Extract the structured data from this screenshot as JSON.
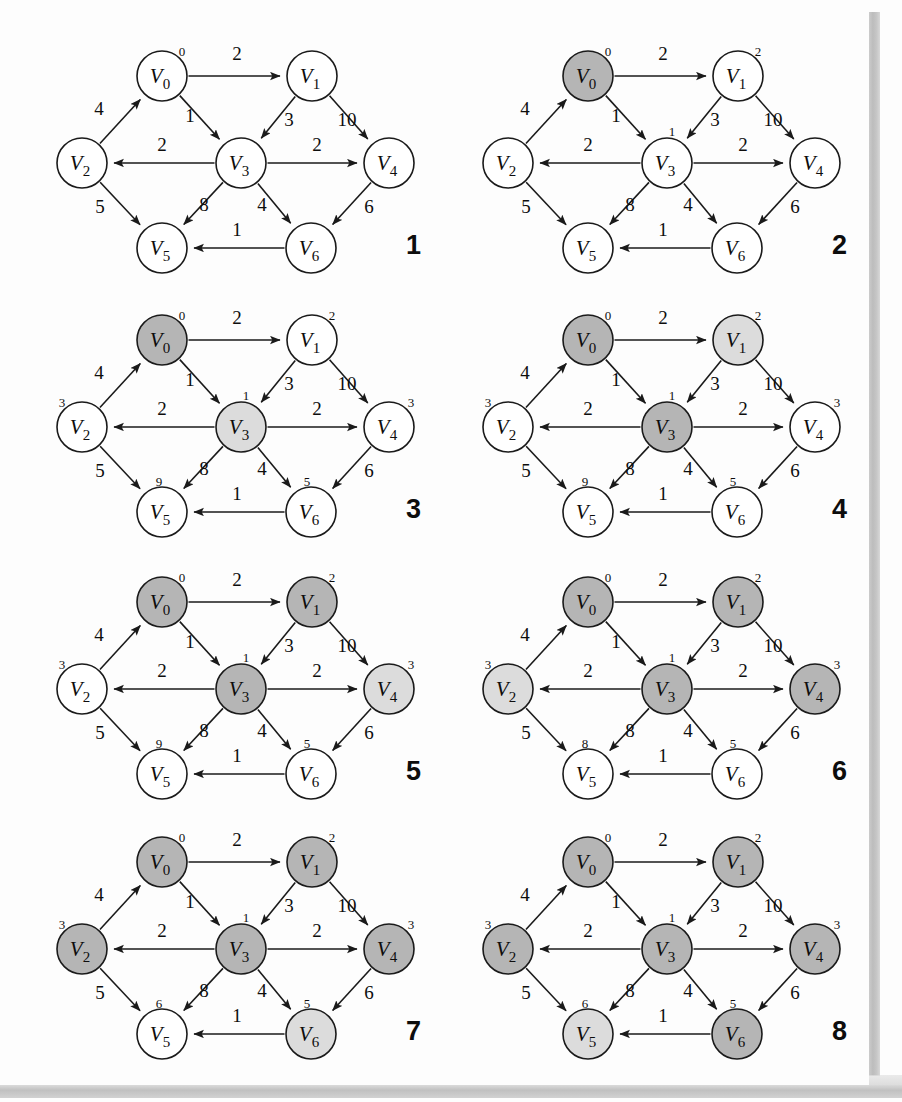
{
  "figure": {
    "type": "diagram",
    "kind": "directed-weighted-graph-algorithm-trace",
    "panel_count": 8,
    "node_ids": [
      "V0",
      "V1",
      "V2",
      "V3",
      "V4",
      "V5",
      "V6"
    ],
    "node_labels": {
      "V0": "V",
      "V1": "V",
      "V2": "V",
      "V3": "V",
      "V4": "V",
      "V5": "V",
      "V6": "V"
    },
    "node_subscripts": {
      "V0": "0",
      "V1": "1",
      "V2": "2",
      "V3": "3",
      "V4": "4",
      "V5": "5",
      "V6": "6"
    },
    "colors": {
      "node_fill_unvisited": "#ffffff",
      "node_fill_frontier": "#dcdcdc",
      "node_fill_visited": "#b5b5b5",
      "stroke": "#1a1a1a",
      "text": "#0d0d0d",
      "page_edge": "#c2c2c2"
    },
    "node_positions": {
      "V0": {
        "x": 148,
        "y": 68
      },
      "V1": {
        "x": 298,
        "y": 68
      },
      "V2": {
        "x": 68,
        "y": 155
      },
      "V3": {
        "x": 227,
        "y": 155
      },
      "V4": {
        "x": 375,
        "y": 155
      },
      "V5": {
        "x": 148,
        "y": 240
      },
      "V6": {
        "x": 297,
        "y": 240
      }
    },
    "node_radius": 25,
    "edges": [
      {
        "from": "V0",
        "to": "V1",
        "weight": "2",
        "label_x": 223,
        "label_y": 52
      },
      {
        "from": "V0",
        "to": "V3",
        "weight": "1",
        "label_x": 176,
        "label_y": 114
      },
      {
        "from": "V2",
        "to": "V0",
        "weight": "4",
        "label_x": 85,
        "label_y": 107
      },
      {
        "from": "V1",
        "to": "V3",
        "weight": "3",
        "label_x": 275,
        "label_y": 118
      },
      {
        "from": "V1",
        "to": "V4",
        "weight": "10",
        "label_x": 333,
        "label_y": 118
      },
      {
        "from": "V3",
        "to": "V2",
        "weight": "2",
        "label_x": 148,
        "label_y": 143
      },
      {
        "from": "V3",
        "to": "V4",
        "weight": "2",
        "label_x": 303,
        "label_y": 143
      },
      {
        "from": "V2",
        "to": "V5",
        "weight": "5",
        "label_x": 86,
        "label_y": 205
      },
      {
        "from": "V3",
        "to": "V5",
        "weight": "8",
        "label_x": 190,
        "label_y": 203
      },
      {
        "from": "V3",
        "to": "V6",
        "weight": "4",
        "label_x": 248,
        "label_y": 203
      },
      {
        "from": "V4",
        "to": "V6",
        "weight": "6",
        "label_x": 355,
        "label_y": 205
      },
      {
        "from": "V6",
        "to": "V5",
        "weight": "1",
        "label_x": 223,
        "label_y": 228
      }
    ],
    "distance_label_offsets": {
      "V0": {
        "dx": 20,
        "dy": -20
      },
      "V1": {
        "dx": 20,
        "dy": -20
      },
      "V2": {
        "dx": -20,
        "dy": -20
      },
      "V3": {
        "dx": 5,
        "dy": -27
      },
      "V4": {
        "dx": 22,
        "dy": -20
      },
      "V5": {
        "dx": -3,
        "dy": -26
      },
      "V6": {
        "dx": -4,
        "dy": -26
      }
    },
    "panels": [
      {
        "number": "1",
        "states": {
          "V0": "unvisited",
          "V1": "unvisited",
          "V2": "unvisited",
          "V3": "unvisited",
          "V4": "unvisited",
          "V5": "unvisited",
          "V6": "unvisited"
        },
        "distances": {
          "V0": "0",
          "V1": "",
          "V2": "",
          "V3": "",
          "V4": "",
          "V5": "",
          "V6": ""
        }
      },
      {
        "number": "2",
        "states": {
          "V0": "visited",
          "V1": "unvisited",
          "V2": "unvisited",
          "V3": "unvisited",
          "V4": "unvisited",
          "V5": "unvisited",
          "V6": "unvisited"
        },
        "distances": {
          "V0": "0",
          "V1": "2",
          "V2": "",
          "V3": "1",
          "V4": "",
          "V5": "",
          "V6": ""
        }
      },
      {
        "number": "3",
        "states": {
          "V0": "visited",
          "V1": "unvisited",
          "V2": "unvisited",
          "V3": "frontier",
          "V4": "unvisited",
          "V5": "unvisited",
          "V6": "unvisited"
        },
        "distances": {
          "V0": "0",
          "V1": "2",
          "V2": "3",
          "V3": "1",
          "V4": "3",
          "V5": "9",
          "V6": "5"
        }
      },
      {
        "number": "4",
        "states": {
          "V0": "visited",
          "V1": "frontier",
          "V2": "unvisited",
          "V3": "visited",
          "V4": "unvisited",
          "V5": "unvisited",
          "V6": "unvisited"
        },
        "distances": {
          "V0": "0",
          "V1": "2",
          "V2": "3",
          "V3": "1",
          "V4": "3",
          "V5": "9",
          "V6": "5"
        }
      },
      {
        "number": "5",
        "states": {
          "V0": "visited",
          "V1": "visited",
          "V2": "unvisited",
          "V3": "visited",
          "V4": "frontier",
          "V5": "unvisited",
          "V6": "unvisited"
        },
        "distances": {
          "V0": "0",
          "V1": "2",
          "V2": "3",
          "V3": "1",
          "V4": "3",
          "V5": "9",
          "V6": "5"
        }
      },
      {
        "number": "6",
        "states": {
          "V0": "visited",
          "V1": "visited",
          "V2": "frontier",
          "V3": "visited",
          "V4": "visited",
          "V5": "unvisited",
          "V6": "unvisited"
        },
        "distances": {
          "V0": "0",
          "V1": "2",
          "V2": "3",
          "V3": "1",
          "V4": "3",
          "V5": "8",
          "V6": "5"
        }
      },
      {
        "number": "7",
        "states": {
          "V0": "visited",
          "V1": "visited",
          "V2": "visited",
          "V3": "visited",
          "V4": "visited",
          "V5": "unvisited",
          "V6": "frontier"
        },
        "distances": {
          "V0": "0",
          "V1": "2",
          "V2": "3",
          "V3": "1",
          "V4": "3",
          "V5": "6",
          "V6": "5"
        }
      },
      {
        "number": "8",
        "states": {
          "V0": "visited",
          "V1": "visited",
          "V2": "visited",
          "V3": "visited",
          "V4": "visited",
          "V5": "frontier",
          "V6": "visited"
        },
        "distances": {
          "V0": "0",
          "V1": "2",
          "V2": "3",
          "V3": "1",
          "V4": "3",
          "V5": "6",
          "V6": "5"
        }
      }
    ],
    "panel_layout": [
      {
        "left": 14,
        "top": 8
      },
      {
        "left": 440,
        "top": 8
      },
      {
        "left": 14,
        "top": 272
      },
      {
        "left": 440,
        "top": 272
      },
      {
        "left": 14,
        "top": 534
      },
      {
        "left": 440,
        "top": 534
      },
      {
        "left": 14,
        "top": 794
      },
      {
        "left": 440,
        "top": 794
      }
    ],
    "panel_number_position": {
      "x": 392,
      "y": 222
    }
  }
}
